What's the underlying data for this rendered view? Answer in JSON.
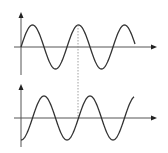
{
  "diagram": {
    "title": "",
    "colors": {
      "axis": "#555555",
      "wave": "#333333",
      "guide": "#888888",
      "background": "#ffffff"
    },
    "graphs": [
      {
        "id": "upper",
        "wave_type": "sine",
        "phase": "starts at zero, rising",
        "cycles_shown": 2.5,
        "origin": [
          21,
          47
        ],
        "x_axis_end": 157,
        "y_axis_top": 13,
        "y_axis_bottom": 75,
        "amplitude_px": 22,
        "wavelength_px": 46,
        "x_start": 21,
        "x_end": 135
      },
      {
        "id": "lower",
        "wave_type": "sine",
        "phase": "starts at trough (lagging by quarter period)",
        "cycles_shown": 2.4,
        "origin": [
          21,
          118
        ],
        "x_axis_end": 157,
        "y_axis_top": 85,
        "y_axis_bottom": 147,
        "amplitude_px": 22,
        "wavelength_px": 46,
        "x_start": 21,
        "x_end": 134
      }
    ],
    "guide_line": {
      "style": "dotted",
      "x": 78,
      "y_from": 25,
      "y_to": 118
    }
  }
}
